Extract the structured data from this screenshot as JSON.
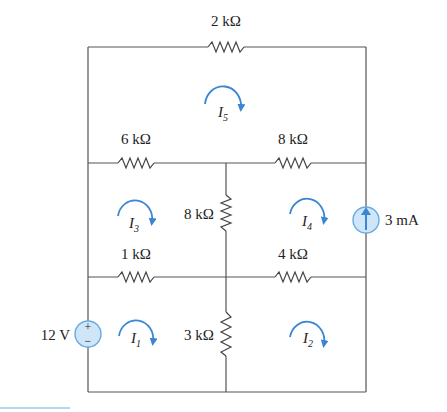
{
  "resistors": {
    "top": "2 kΩ",
    "mid_left": "6 kΩ",
    "mid_right": "8 kΩ",
    "center_upper": "8 kΩ",
    "lower_left": "1 kΩ",
    "lower_right": "4 kΩ",
    "center_lower": "3 kΩ"
  },
  "sources": {
    "voltage": "12 V",
    "current": "3 mA",
    "voltage_plus": "+",
    "voltage_minus": "−"
  },
  "loops": [
    {
      "name": "I",
      "sub": "1"
    },
    {
      "name": "I",
      "sub": "2"
    },
    {
      "name": "I",
      "sub": "3"
    },
    {
      "name": "I",
      "sub": "4"
    },
    {
      "name": "I",
      "sub": "5"
    }
  ],
  "colors": {
    "accent": "#3a86d4",
    "source_fill": "#cfe6f8",
    "wire": "#555555"
  }
}
